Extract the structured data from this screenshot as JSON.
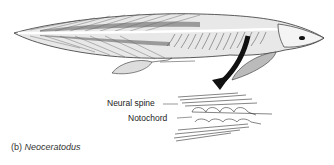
{
  "figure": {
    "caption_prefix": "(b)",
    "caption_genus": "Neoceratodus",
    "labels": {
      "neural_spine": "Neural spine",
      "notochord": "Notochord"
    },
    "colors": {
      "ink": "#222222",
      "background": "#ffffff"
    }
  }
}
